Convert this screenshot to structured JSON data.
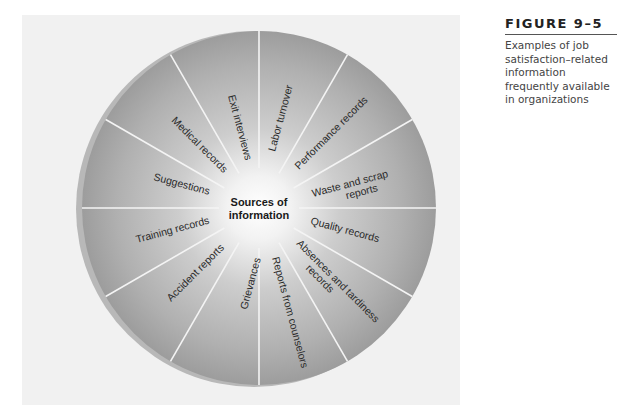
{
  "figure": {
    "number": "FIGURE 9–5",
    "caption": "Examples of job satisfaction–related information frequently available in organizations"
  },
  "diagram": {
    "type": "radial-wheel",
    "center_label_line1": "Sources of",
    "center_label_line2": "information",
    "segments": [
      {
        "label": "Labor turnover"
      },
      {
        "label": "Performance records"
      },
      {
        "label_line1": "Waste and scrap",
        "label_line2": "reports"
      },
      {
        "label": "Quality records"
      },
      {
        "label_line1": "Absences and tardiness",
        "label_line2": "records"
      },
      {
        "label": "Reports from counselors"
      },
      {
        "label": "Grievances"
      },
      {
        "label": "Accident reports"
      },
      {
        "label": "Training records"
      },
      {
        "label": "Suggestions"
      },
      {
        "label": "Medical records"
      },
      {
        "label": "Exit interviews"
      }
    ],
    "colors": {
      "panel": "#f1f1f1",
      "disc_center": "#ffffff",
      "disc_edge": "#9a9a9a",
      "rim": "#b4b4b4",
      "divider": "#f4f4f4"
    }
  }
}
